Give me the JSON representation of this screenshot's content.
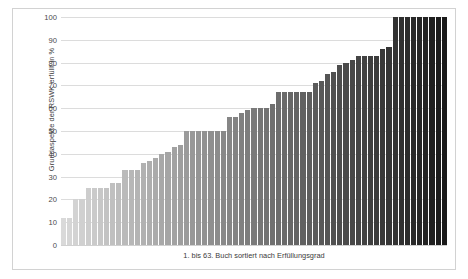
{
  "chart_data": {
    "type": "bar",
    "title": "",
    "subtitle": "",
    "xlabel": "1. bis 63. Buch sortiert nach Erfüllungsgrad",
    "ylabel": "Grundaspekte der RSWK erfüllt in %",
    "ylim": [
      0,
      100
    ],
    "ytick_labels": [
      "100",
      "90",
      "80",
      "70",
      "60",
      "50",
      "40",
      "30",
      "20",
      "10",
      "0"
    ],
    "ytick_values": [
      100,
      90,
      80,
      70,
      60,
      50,
      40,
      30,
      20,
      10,
      0
    ],
    "grid": true,
    "legend": "none",
    "xtick_labels": [],
    "categories": [
      "1",
      "2",
      "3",
      "4",
      "5",
      "6",
      "7",
      "8",
      "9",
      "10",
      "11",
      "12",
      "13",
      "14",
      "15",
      "16",
      "17",
      "18",
      "19",
      "20",
      "21",
      "22",
      "23",
      "24",
      "25",
      "26",
      "27",
      "28",
      "29",
      "30",
      "31",
      "32",
      "33",
      "34",
      "35",
      "36",
      "37",
      "38",
      "39",
      "40",
      "41",
      "42",
      "43",
      "44",
      "45",
      "46",
      "47",
      "48",
      "49",
      "50",
      "51",
      "52",
      "53",
      "54",
      "55",
      "56",
      "57",
      "58",
      "59",
      "60",
      "61",
      "62",
      "63"
    ],
    "values": [
      12,
      12,
      20,
      20,
      25,
      25,
      25,
      25,
      27,
      27,
      33,
      33,
      33,
      36,
      37,
      38,
      40,
      41,
      43,
      44,
      50,
      50,
      50,
      50,
      50,
      50,
      50,
      56,
      56,
      58,
      59,
      60,
      60,
      60,
      62,
      67,
      67,
      67,
      67,
      67,
      67,
      71,
      72,
      75,
      76,
      79,
      80,
      81,
      83,
      83,
      83,
      83,
      86,
      87,
      100,
      100,
      100,
      100,
      100,
      100,
      100,
      100,
      100
    ],
    "bar_color_start": "#d9d9d9",
    "bar_color_end": "#1a1a1a",
    "gridline_color": "#dcdcdc",
    "plot_background": "#ffffff",
    "frame_border_color": "#d2d2d2"
  }
}
